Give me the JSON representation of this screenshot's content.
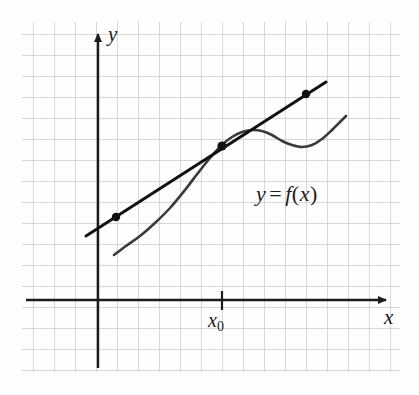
{
  "figure": {
    "kind": "math-diagram",
    "background_color": "#fefefe",
    "grid": {
      "color": "#c9c9cf",
      "spacing_px": 21,
      "left": 22,
      "top": 22,
      "right": 400,
      "bottom": 372,
      "visible": true
    },
    "axes": {
      "color": "#1c1c1c",
      "x_axis": {
        "label": "x",
        "y_px": 300,
        "x_start_px": 26,
        "x_end_px": 390,
        "arrow": "right"
      },
      "y_axis": {
        "label": "y",
        "x_px": 98,
        "y_start_px": 368,
        "y_end_px": 30,
        "arrow": "up"
      }
    },
    "tick": {
      "label": "x",
      "subscript": "0",
      "x_px": 222,
      "axis": "x"
    },
    "curve_label": {
      "text": "y = f(x)",
      "y_part": "y",
      "equals": "=",
      "f_part": "f",
      "open_paren": "(",
      "x_part": "x",
      "close_paren": ")"
    },
    "series": [
      {
        "name": "function-curve",
        "role": "curve",
        "color": "#3a3a3a",
        "stroke_width": 2.6,
        "points": [
          [
            114,
            255
          ],
          [
            126,
            246
          ],
          [
            140,
            236
          ],
          [
            155,
            223
          ],
          [
            170,
            208
          ],
          [
            185,
            190
          ],
          [
            198,
            173
          ],
          [
            210,
            158
          ],
          [
            222,
            145
          ],
          [
            232,
            137
          ],
          [
            242,
            132
          ],
          [
            252,
            130
          ],
          [
            262,
            131
          ],
          [
            272,
            135
          ],
          [
            282,
            141
          ],
          [
            292,
            145
          ],
          [
            302,
            147
          ],
          [
            312,
            145
          ],
          [
            322,
            139
          ],
          [
            332,
            130
          ],
          [
            341,
            121
          ],
          [
            346,
            116
          ]
        ]
      },
      {
        "name": "tangent-line",
        "role": "line",
        "color": "#111111",
        "stroke_width": 3.0,
        "x1": 86,
        "y1": 236,
        "x2": 326,
        "y2": 82
      }
    ],
    "marked_points": [
      {
        "name": "left-point",
        "x": 116,
        "y": 217,
        "radius": 4.2,
        "color": "#111111"
      },
      {
        "name": "tangency-point",
        "x": 222,
        "y": 146,
        "radius": 4.6,
        "color": "#111111"
      },
      {
        "name": "right-point",
        "x": 306,
        "y": 94,
        "radius": 4.2,
        "color": "#111111"
      }
    ]
  }
}
